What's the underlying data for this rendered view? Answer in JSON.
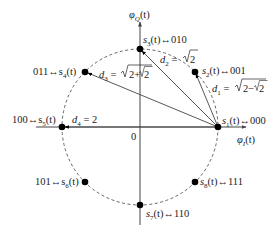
{
  "axes": {
    "x_label": "φ_I(t)",
    "y_label": "φ_Q(t)",
    "origin_label": "0"
  },
  "colors": {
    "line": "#444444",
    "point": "#000000",
    "text": "#222222",
    "circle": "#555555"
  },
  "points": [
    {
      "id": "s1",
      "label": "s1(t)↔000",
      "bits": "000",
      "angle_deg": 0
    },
    {
      "id": "s2",
      "label": "s2(t)↔001",
      "bits": "001",
      "angle_deg": 45
    },
    {
      "id": "s3",
      "label": "s3(t)↔010",
      "bits": "010",
      "angle_deg": 90
    },
    {
      "id": "s4",
      "label": "011↔s4(t)",
      "bits": "011",
      "angle_deg": 135
    },
    {
      "id": "s5",
      "label": "100↔s5(t)",
      "bits": "100",
      "angle_deg": 180
    },
    {
      "id": "s6",
      "label": "101↔s6(t)",
      "bits": "101",
      "angle_deg": 225
    },
    {
      "id": "s7",
      "label": "s7(t)↔110",
      "bits": "110",
      "angle_deg": 270
    },
    {
      "id": "s8",
      "label": "s8(t)↔111",
      "bits": "111",
      "angle_deg": 315
    }
  ],
  "distances": [
    {
      "id": "d1",
      "label": "d1 = √(2−√2)",
      "from": "s1",
      "to": "s2"
    },
    {
      "id": "d2",
      "label": "d2 = √2",
      "from": "s1",
      "to": "s3"
    },
    {
      "id": "d3",
      "label": "d3 = √(2+√2)",
      "from": "s1",
      "to": "s4"
    },
    {
      "id": "d4",
      "label": "d4 = 2",
      "from": "s1",
      "to": "s5"
    }
  ],
  "text": {
    "phiI": "φ",
    "phiI_sub": "I",
    "phiQ": "φ",
    "phiQ_sub": "Q",
    "t": "(t)",
    "zero": "0",
    "s1_pre": "s",
    "s1_sub": "1",
    "s1_post": "(t)↔000",
    "s2_pre": "s",
    "s2_sub": "2",
    "s2_post": "(t)↔001",
    "s3_pre": "s",
    "s3_sub": "3",
    "s3_post": "(t)↔010",
    "s4_pre": "011↔s",
    "s4_sub": "4",
    "s4_post": "(t)",
    "s5_pre": "100↔s",
    "s5_sub": "5",
    "s5_post": "(t)",
    "s6_pre": "101↔s",
    "s6_sub": "6",
    "s6_post": "(t)",
    "s7_pre": "s",
    "s7_sub": "7",
    "s7_post": "(t)↔110",
    "s8_pre": "s",
    "s8_sub": "8",
    "s8_post": "(t)↔111",
    "d1_pre": "d",
    "d1_sub": "1",
    "d1_eq": " = ",
    "d1_val": "2−",
    "d2_pre": "d",
    "d2_sub": "2",
    "d2_eq": " = ",
    "d2_val": "2",
    "d3_pre": "d",
    "d3_sub": "3",
    "d3_eq": " = ",
    "d3_val": "2+",
    "d4_pre": "d",
    "d4_sub": "4",
    "d4_eq": " = 2",
    "two": "2"
  }
}
